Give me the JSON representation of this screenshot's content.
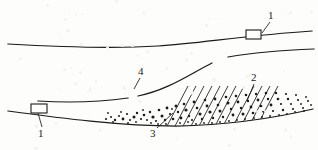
{
  "figure": {
    "kind": "geological-cross-section-line-drawing",
    "background_color": "#fdfdfc",
    "ink_color": "#1a1a1a",
    "width": 318,
    "height": 150,
    "callouts": [
      {
        "id": "callout-1-top",
        "text": "1",
        "x": 268,
        "y": 10,
        "leader": [
          [
            270,
            22
          ],
          [
            262,
            33
          ]
        ]
      },
      {
        "id": "callout-1-bottom",
        "text": "1",
        "x": 38,
        "y": 128,
        "leader": [
          [
            42,
            127
          ],
          [
            38,
            113
          ]
        ]
      },
      {
        "id": "callout-2",
        "text": "2",
        "x": 251,
        "y": 72,
        "leader": [
          [
            254,
            84
          ],
          [
            247,
            101
          ]
        ]
      },
      {
        "id": "callout-3",
        "text": "3",
        "x": 150,
        "y": 128,
        "leader": [
          [
            157,
            128
          ],
          [
            173,
            113
          ]
        ]
      },
      {
        "id": "callout-4",
        "text": "4",
        "x": 138,
        "y": 66,
        "leader": [
          [
            140,
            78
          ],
          [
            134,
            89
          ]
        ]
      }
    ],
    "buildings": [
      {
        "id": "building-right",
        "x": 246,
        "y": 30,
        "w": 15,
        "h": 9
      },
      {
        "id": "building-left",
        "x": 31,
        "y": 104,
        "w": 16,
        "h": 9
      }
    ],
    "strata_lines": {
      "upper_surface": "M 8,44 C 60,47 110,49 158,46 C 200,43 250,35 312,31",
      "middle_boundary_segments": [
        "M 38,101 C 70,103 100,102 128,98",
        "M 138,96 C 168,90 190,74 212,63",
        "M 228,57 C 256,52 285,50 314,49"
      ],
      "lower_boundary": "M 8,111 C 60,118 120,126 176,126 C 230,125 275,118 313,109"
    },
    "hatch_bands": [
      {
        "id": "hatch-band-1",
        "x1": 166,
        "x2": 174
      },
      {
        "id": "hatch-band-2",
        "x1": 182,
        "x2": 190
      },
      {
        "id": "hatch-band-3",
        "x1": 198,
        "x2": 206
      },
      {
        "id": "hatch-band-4",
        "x1": 214,
        "x2": 222
      },
      {
        "id": "hatch-band-5",
        "x1": 232,
        "x2": 240
      },
      {
        "id": "hatch-band-6",
        "x1": 248,
        "x2": 256
      }
    ],
    "dot_field": {
      "description": "dense clast speckle between lower boundary and middle boundary",
      "x_start": 104,
      "x_end": 314,
      "dots": [
        [
          106,
          119,
          1.1
        ],
        [
          111,
          117,
          1.0
        ],
        [
          115,
          120,
          1.2
        ],
        [
          119,
          116,
          1.0
        ],
        [
          123,
          119,
          1.4
        ],
        [
          127,
          114,
          1.1
        ],
        [
          130,
          120,
          1.0
        ],
        [
          134,
          117,
          1.5
        ],
        [
          137,
          113,
          1.2
        ],
        [
          141,
          119,
          1.1
        ],
        [
          144,
          115,
          1.3
        ],
        [
          147,
          120,
          1.0
        ],
        [
          150,
          112,
          1.2
        ],
        [
          153,
          117,
          1.6
        ],
        [
          156,
          121,
          1.1
        ],
        [
          159,
          110,
          1.3
        ],
        [
          162,
          116,
          1.5
        ],
        [
          165,
          120,
          1.2
        ],
        [
          167,
          108,
          1.4
        ],
        [
          170,
          114,
          1.1
        ],
        [
          173,
          119,
          1.3
        ],
        [
          176,
          106,
          1.5
        ],
        [
          178,
          112,
          1.2
        ],
        [
          181,
          118,
          1.4
        ],
        [
          184,
          104,
          1.3
        ],
        [
          186,
          110,
          1.6
        ],
        [
          189,
          116,
          1.2
        ],
        [
          192,
          120,
          1.1
        ],
        [
          194,
          102,
          1.4
        ],
        [
          197,
          108,
          1.3
        ],
        [
          200,
          114,
          1.5
        ],
        [
          202,
          119,
          1.2
        ],
        [
          205,
          100,
          1.3
        ],
        [
          207,
          106,
          1.4
        ],
        [
          210,
          112,
          1.6
        ],
        [
          213,
          118,
          1.2
        ],
        [
          215,
          99,
          1.4
        ],
        [
          218,
          105,
          1.3
        ],
        [
          220,
          111,
          1.5
        ],
        [
          223,
          117,
          1.2
        ],
        [
          226,
          97,
          1.3
        ],
        [
          228,
          103,
          1.5
        ],
        [
          231,
          109,
          1.2
        ],
        [
          233,
          115,
          1.4
        ],
        [
          236,
          96,
          1.3
        ],
        [
          238,
          102,
          1.4
        ],
        [
          241,
          108,
          1.2
        ],
        [
          243,
          114,
          1.5
        ],
        [
          246,
          95,
          1.3
        ],
        [
          248,
          101,
          1.2
        ],
        [
          251,
          107,
          1.4
        ],
        [
          253,
          113,
          1.3
        ],
        [
          256,
          94,
          1.2
        ],
        [
          258,
          100,
          1.4
        ],
        [
          261,
          106,
          1.3
        ],
        [
          263,
          112,
          1.1
        ],
        [
          266,
          93,
          1.3
        ],
        [
          268,
          99,
          1.2
        ],
        [
          271,
          105,
          1.4
        ],
        [
          273,
          111,
          1.1
        ],
        [
          276,
          93,
          1.2
        ],
        [
          278,
          99,
          1.3
        ],
        [
          281,
          104,
          1.1
        ],
        [
          283,
          110,
          1.2
        ],
        [
          286,
          94,
          1.1
        ],
        [
          288,
          99,
          1.2
        ],
        [
          291,
          104,
          1.0
        ],
        [
          293,
          109,
          1.1
        ],
        [
          296,
          95,
          1.0
        ],
        [
          298,
          100,
          1.1
        ],
        [
          301,
          104,
          0.9
        ],
        [
          303,
          108,
          1.0
        ],
        [
          306,
          97,
          0.9
        ],
        [
          308,
          101,
          1.0
        ],
        [
          311,
          105,
          0.9
        ],
        [
          108,
          113,
          0.9
        ],
        [
          113,
          122,
          0.9
        ],
        [
          121,
          112,
          0.9
        ],
        [
          128,
          123,
          0.9
        ],
        [
          136,
          122,
          0.9
        ],
        [
          143,
          110,
          0.9
        ],
        [
          151,
          123,
          0.9
        ],
        [
          158,
          124,
          0.9
        ],
        [
          166,
          124,
          0.9
        ],
        [
          172,
          109,
          0.9
        ],
        [
          180,
          123,
          0.9
        ],
        [
          188,
          122,
          0.9
        ],
        [
          196,
          124,
          0.9
        ],
        [
          204,
          123,
          0.9
        ],
        [
          212,
          123,
          0.9
        ],
        [
          220,
          122,
          0.9
        ],
        [
          229,
          121,
          0.9
        ],
        [
          237,
          120,
          0.9
        ],
        [
          245,
          119,
          0.9
        ],
        [
          254,
          118,
          0.9
        ],
        [
          262,
          117,
          0.9
        ],
        [
          270,
          116,
          0.9
        ],
        [
          279,
          115,
          0.9
        ],
        [
          287,
          114,
          0.9
        ],
        [
          295,
          112,
          0.9
        ],
        [
          304,
          111,
          0.9
        ]
      ]
    }
  }
}
